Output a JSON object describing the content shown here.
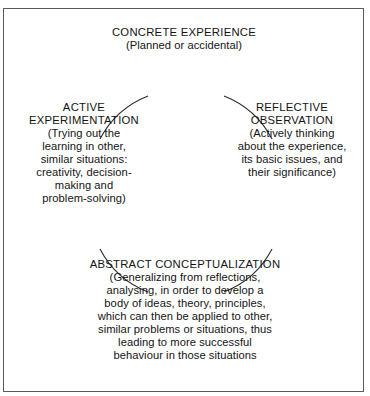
{
  "diagram": {
    "name": "experiential-learning-cycle",
    "frame_color": "#5a5a5a",
    "text_color": "#141414",
    "background_color": "#ffffff",
    "circle": {
      "center_x": 182,
      "center_y": 185,
      "radius": 92,
      "stroke_color": "#2b2b2b"
    },
    "stages": [
      {
        "id": "concrete-experience",
        "title": "CONCRETE EXPERIENCE",
        "body": "(Planned or accidental)",
        "position": "top"
      },
      {
        "id": "reflective-observation",
        "title": "REFLECTIVE\nOBSERVATION",
        "body": "(Actively thinking\nabout the experience,\nits basic issues, and\ntheir significance)",
        "position": "right"
      },
      {
        "id": "abstract-conceptualization",
        "title": "ABSTRACT CONCEPTUALIZATION",
        "body": "(Generalizing from reflections,\nanalysing, in order to develop a\nbody of ideas, theory, principles,\nwhich can then be applied to other,\nsimilar problems or situations, thus\nleading to more successful\nbehaviour in those situations",
        "position": "bottom"
      },
      {
        "id": "active-experimentation",
        "title": "ACTIVE\nEXPERIMENTATION",
        "body": "(Trying out the\nlearning in other,\nsimilar situations:\ncreativity, decision-\nmaking and\nproblem-solving)",
        "position": "left"
      }
    ]
  }
}
